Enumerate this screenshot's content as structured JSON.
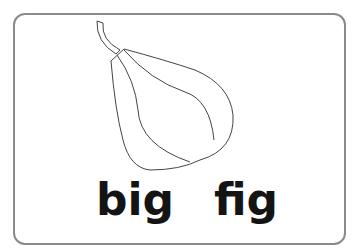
{
  "card": {
    "words": [
      "big",
      "fig"
    ],
    "illustration": "fig-outline"
  }
}
